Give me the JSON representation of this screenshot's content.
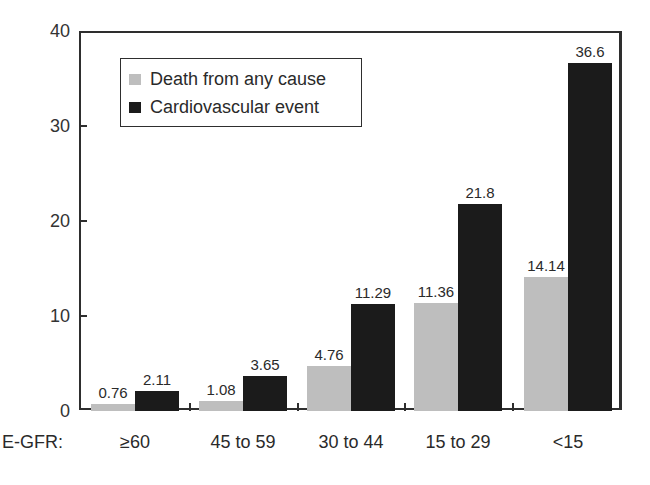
{
  "chart_data": {
    "type": "bar",
    "title": "",
    "xlabel": "E-GFR:",
    "ylabel": "",
    "ylim": [
      0,
      40
    ],
    "yticks": [
      0,
      10,
      20,
      30,
      40
    ],
    "categories": [
      "≥60",
      "45 to 59",
      "30 to 44",
      "15 to 29",
      "<15"
    ],
    "series": [
      {
        "name": "Death from any cause",
        "color": "#bebebe",
        "values": [
          0.76,
          1.08,
          4.76,
          11.36,
          14.14
        ]
      },
      {
        "name": "Cardiovascular event",
        "color": "#1b1b1b",
        "values": [
          2.11,
          3.65,
          11.29,
          21.8,
          36.6
        ]
      }
    ],
    "value_labels": {
      "death": [
        "0.76",
        "1.08",
        "4.76",
        "11.36",
        "14.14"
      ],
      "cv": [
        "2.11",
        "3.65",
        "11.29",
        "21.8",
        "36.6"
      ]
    },
    "legend_position": "upper left inside",
    "grid": false
  },
  "axis": {
    "x_name": "E-GFR:",
    "y_tick_labels": [
      "0",
      "10",
      "20",
      "30",
      "40"
    ]
  },
  "legend": {
    "items": [
      {
        "label": "Death from any cause",
        "color": "#bebebe"
      },
      {
        "label": "Cardiovascular event",
        "color": "#1b1b1b"
      }
    ]
  }
}
